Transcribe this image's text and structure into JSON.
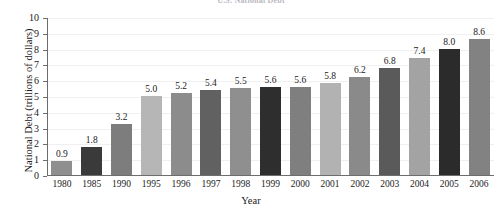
{
  "chart_data": {
    "type": "bar",
    "title": "U.S. National Debt",
    "xlabel": "Year",
    "ylabel": "National Debt (trillions of dollars)",
    "ylim": [
      0,
      10
    ],
    "ytick_labels": [
      "10",
      "9",
      "8",
      "7",
      "6",
      "5",
      "4",
      "3",
      "2",
      "1",
      "0"
    ],
    "yticks": [
      10,
      9,
      8,
      7,
      6,
      5,
      4,
      3,
      2,
      1,
      0
    ],
    "grid": "horizontal",
    "legend": "none",
    "categories": [
      "1980",
      "1985",
      "1990",
      "1995",
      "1996",
      "1997",
      "1998",
      "1999",
      "2000",
      "2001",
      "2002",
      "2003",
      "2004",
      "2005",
      "2006"
    ],
    "values": [
      0.9,
      1.8,
      3.2,
      5.0,
      5.2,
      5.4,
      5.5,
      5.6,
      5.6,
      5.8,
      6.2,
      6.8,
      7.4,
      8.0,
      8.6
    ],
    "value_labels": [
      "0.9",
      "1.8",
      "3.2",
      "5.0",
      "5.2",
      "5.4",
      "5.5",
      "5.6",
      "5.6",
      "5.8",
      "6.2",
      "6.8",
      "7.4",
      "8.0",
      "8.6"
    ],
    "bar_colors": [
      "#8f8f8f",
      "#3a3a3a",
      "#7d7d7d",
      "#b6b6b6",
      "#8c8c8c",
      "#616161",
      "#8f8f8f",
      "#2e2e2e",
      "#7f7f7f",
      "#b2b2b2",
      "#8a8a8a",
      "#5a5a5a",
      "#a3a3a3",
      "#2b2b2b",
      "#828282"
    ],
    "axis_color": "#6d6d6d",
    "grid_color": "#f0f0f2",
    "text_color": "#1a1a1a"
  }
}
